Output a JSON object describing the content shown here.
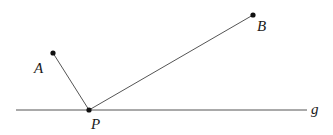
{
  "diagram": {
    "points": {
      "A": {
        "label": "A",
        "x": 53,
        "y": 53
      },
      "B": {
        "label": "B",
        "x": 253,
        "y": 15
      },
      "P": {
        "label": "P",
        "x": 89,
        "y": 110
      }
    },
    "line": {
      "label": "g",
      "x1": 16,
      "x2": 307,
      "y": 110
    },
    "segments": [
      [
        "A",
        "P"
      ],
      [
        "P",
        "B"
      ]
    ],
    "colors": {
      "stroke": "#555555",
      "point": "#111111",
      "text": "#1a1a1a"
    }
  }
}
